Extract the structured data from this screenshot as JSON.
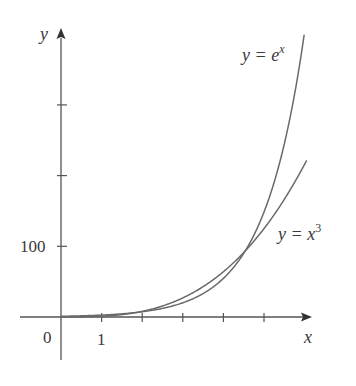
{
  "chart_data": {
    "type": "line",
    "title": "",
    "xlabel": "x",
    "ylabel": "y",
    "xlim": [
      -1,
      6.2
    ],
    "ylim": [
      -60,
      410
    ],
    "grid": false,
    "legend": "none (inline curve labels)",
    "x_ticks": [
      1,
      2,
      3,
      4,
      5
    ],
    "x_tick_labels": [
      "1"
    ],
    "y_ticks": [
      100,
      200,
      300
    ],
    "y_tick_labels": [
      "100"
    ],
    "origin_label": "0",
    "series": [
      {
        "name": "y = e^x",
        "function": "exp(x)",
        "x": [
          0,
          1,
          2,
          3,
          4,
          4.5,
          5,
          5.5,
          6
        ],
        "values": [
          1,
          2.72,
          7.39,
          20.09,
          54.6,
          90.0,
          148.4,
          244.7,
          403.4
        ]
      },
      {
        "name": "y = x^3",
        "function": "x^3",
        "x": [
          0,
          1,
          2,
          3,
          4,
          4.5,
          5,
          5.5,
          6
        ],
        "values": [
          0,
          1,
          8,
          27,
          64,
          91.1,
          125,
          166.4,
          216
        ]
      }
    ],
    "annotations": [
      {
        "text": "y = e^x",
        "near": "top of steeper curve"
      },
      {
        "text": "y = x^3",
        "near": "right end of flatter curve"
      }
    ]
  },
  "labels": {
    "y_axis": "y",
    "x_axis": "x",
    "origin": "0",
    "x_tick_1": "1",
    "y_tick_100": "100",
    "exp_prefix": "y = e",
    "exp_sup": "x",
    "cube_prefix": "y = x",
    "cube_sup": "3"
  },
  "colors": {
    "axis": "#555555",
    "curve": "#6a6a6a",
    "text": "#3a3a3a",
    "background": "#ffffff"
  }
}
